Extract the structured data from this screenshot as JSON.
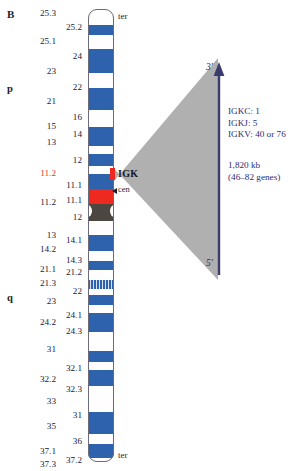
{
  "figure": {
    "panel_letter": "B",
    "arms": {
      "p": "p",
      "q": "q"
    },
    "ter_top": "ter",
    "ter_bottom": "ter",
    "cen": "cen",
    "gene_label": "IGK"
  },
  "annotations": {
    "prime3": "3'",
    "prime5": "5'",
    "gene_counts": [
      "IGKC: 1",
      "IGKJ: 5",
      "IGKV: 40 or 76"
    ],
    "size_lines": [
      "1,820 kb",
      "(46–82 genes)"
    ]
  },
  "colors": {
    "band_blue": "#2f62ad",
    "band_blue_light": "#4f7fc0",
    "band_white": "#fefeff",
    "highlight_red": "#ee2a20",
    "centromere": "#4b463f",
    "wedge_grey": "#a9a9a9",
    "annotation_blue": "#2c2c78",
    "highlight_text": "#e2352a",
    "outline": "#6a6a78"
  },
  "chart_data": {
    "type": "table",
    "xlabel": "",
    "ylabel": "cytogenetic band",
    "legend": [],
    "locus": {
      "gene": "IGK",
      "band": "2p11.2",
      "size_kb": 1820,
      "gene_count_min": 46,
      "gene_count_max": 82,
      "segments": {
        "IGKC": 1,
        "IGKJ": 5,
        "IGKV_min": 40,
        "IGKV_max": 76
      },
      "orientation_top": "3'",
      "orientation_bottom": "5'"
    },
    "label_columns": {
      "outer": [
        {
          "text": "25.3",
          "top": 9,
          "highlight": false
        },
        {
          "text": "25.1",
          "top": 37,
          "highlight": false
        },
        {
          "text": "23",
          "top": 67,
          "highlight": false
        },
        {
          "text": "21",
          "top": 97,
          "highlight": false
        },
        {
          "text": "15",
          "top": 122,
          "highlight": false
        },
        {
          "text": "13",
          "top": 138,
          "highlight": false
        },
        {
          "text": "11.2",
          "top": 169,
          "highlight": true
        },
        {
          "text": "11.2",
          "top": 198,
          "highlight": false
        },
        {
          "text": "13",
          "top": 231,
          "highlight": false
        },
        {
          "text": "14.2",
          "top": 245,
          "highlight": false
        },
        {
          "text": "21.1",
          "top": 265,
          "highlight": false
        },
        {
          "text": "21.3",
          "top": 279,
          "highlight": false
        },
        {
          "text": "23",
          "top": 297,
          "highlight": false
        },
        {
          "text": "24.2",
          "top": 318,
          "highlight": false
        },
        {
          "text": "31",
          "top": 345,
          "highlight": false
        },
        {
          "text": "32.2",
          "top": 375,
          "highlight": false
        },
        {
          "text": "33",
          "top": 397,
          "highlight": false
        },
        {
          "text": "35",
          "top": 422,
          "highlight": false
        },
        {
          "text": "37.1",
          "top": 447,
          "highlight": false
        },
        {
          "text": "37.3",
          "top": 460,
          "highlight": false
        }
      ],
      "inner": [
        {
          "text": "25.2",
          "top": 23
        },
        {
          "text": "24",
          "top": 52
        },
        {
          "text": "22",
          "top": 83
        },
        {
          "text": "16",
          "top": 113
        },
        {
          "text": "14",
          "top": 130
        },
        {
          "text": "12",
          "top": 156
        },
        {
          "text": "11.1",
          "top": 181
        },
        {
          "text": "11.1",
          "top": 196
        },
        {
          "text": "12",
          "top": 213
        },
        {
          "text": "14.1",
          "top": 236
        },
        {
          "text": "14.3",
          "top": 256
        },
        {
          "text": "21.2",
          "top": 268
        },
        {
          "text": "22",
          "top": 287
        },
        {
          "text": "24.1",
          "top": 311
        },
        {
          "text": "24.3",
          "top": 327
        },
        {
          "text": "32.1",
          "top": 364
        },
        {
          "text": "32.3",
          "top": 385
        },
        {
          "text": "31",
          "top": 411
        },
        {
          "text": "36",
          "top": 437
        },
        {
          "text": "37.2",
          "top": 456
        }
      ]
    },
    "bands": [
      {
        "top": 0,
        "height": 16,
        "style": "white"
      },
      {
        "top": 16,
        "height": 11,
        "style": "blue"
      },
      {
        "top": 27,
        "height": 13,
        "style": "white"
      },
      {
        "top": 40,
        "height": 24,
        "style": "blue"
      },
      {
        "top": 64,
        "height": 15,
        "style": "white"
      },
      {
        "top": 79,
        "height": 22,
        "style": "blue"
      },
      {
        "top": 101,
        "height": 17,
        "style": "white"
      },
      {
        "top": 118,
        "height": 19,
        "style": "blue"
      },
      {
        "top": 137,
        "height": 8,
        "style": "white"
      },
      {
        "top": 145,
        "height": 12,
        "style": "blue"
      },
      {
        "top": 157,
        "height": 9,
        "style": "white"
      },
      {
        "top": 166,
        "height": 22,
        "style": "blue"
      },
      {
        "top": 188,
        "height": 0,
        "style": "white"
      }
    ]
  }
}
